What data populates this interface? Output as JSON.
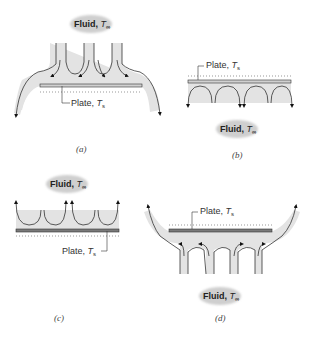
{
  "figure": {
    "panels": [
      {
        "id": "a",
        "caption": "(a)",
        "fluid_label": "Fluid,",
        "fluid_symbol": "T",
        "fluid_sub": "∞",
        "plate_label": "Plate,",
        "plate_symbol": "T",
        "plate_sub": "s"
      },
      {
        "id": "b",
        "caption": "(b)",
        "fluid_label": "Fluid,",
        "fluid_symbol": "T",
        "fluid_sub": "∞",
        "plate_label": "Plate,",
        "plate_symbol": "T",
        "plate_sub": "s"
      },
      {
        "id": "c",
        "caption": "(c)",
        "fluid_label": "Fluid,",
        "fluid_symbol": "T",
        "fluid_sub": "∞",
        "plate_label": "Plate,",
        "plate_symbol": "T",
        "plate_sub": "s"
      },
      {
        "id": "d",
        "caption": "(d)",
        "fluid_label": "Fluid,",
        "fluid_symbol": "T",
        "fluid_sub": "∞",
        "plate_label": "Plate,",
        "plate_symbol": "T",
        "plate_sub": "s"
      }
    ],
    "colors": {
      "fluid_fill": "#e3e3e3",
      "plate_light": "#d0d0d0",
      "plate_dark": "#7a7a7a",
      "line": "#333333",
      "cloud": "#cfcfcf"
    }
  }
}
